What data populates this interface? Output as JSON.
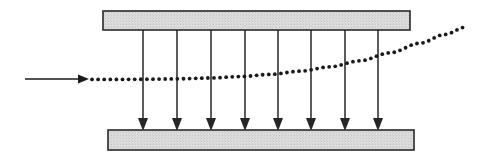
{
  "figure": {
    "canvas": {
      "width": 495,
      "height": 164,
      "background": "#ffffff"
    },
    "colors": {
      "plate_fill": "#d9d9d9",
      "plate_stroke": "#2a2a2a",
      "field_arrow": "#262626",
      "beam_arrow": "#1a1a1a",
      "trajectory_dot": "#1a1a1a"
    }
  },
  "plates": {
    "top": {
      "label": "top-plate",
      "x": 103,
      "y": 11,
      "width": 307,
      "height": 19,
      "fill": "#d9d9d9",
      "stroke": "#2a2a2a",
      "stroke_width": 1.6
    },
    "bottom": {
      "label": "bottom-plate",
      "x": 108,
      "y": 130,
      "width": 306,
      "height": 20,
      "fill": "#d9d9d9",
      "stroke": "#2a2a2a",
      "stroke_width": 1.6
    }
  },
  "field_arrows": {
    "label": "uniform-field-arrows",
    "count": 8,
    "direction": "downward",
    "y_start": 30,
    "y_end": 131,
    "stroke": "#262626",
    "stroke_width": 1.5,
    "head_width": 10,
    "head_length": 13,
    "x_positions": [
      143,
      177,
      211,
      245,
      278,
      311,
      345,
      378
    ]
  },
  "beam_arrow": {
    "label": "incoming-beam-arrow",
    "x_start": 25,
    "x_end": 89,
    "y": 79,
    "stroke": "#1a1a1a",
    "stroke_width": 1.6,
    "head_width": 9,
    "head_length": 11
  },
  "trajectory": {
    "label": "deflected-beam-path",
    "style": "dotted",
    "dot_radius": 1.9,
    "dot_spacing": 6.1,
    "color": "#1a1a1a",
    "x_start": 92,
    "x_end": 466,
    "y_start": 79,
    "y_end": 27,
    "curve_points": [
      [
        92,
        79.4
      ],
      [
        120,
        79.4
      ],
      [
        150,
        79.2
      ],
      [
        180,
        78.8
      ],
      [
        210,
        78.0
      ],
      [
        240,
        76.6
      ],
      [
        270,
        74.4
      ],
      [
        300,
        71.2
      ],
      [
        330,
        66.8
      ],
      [
        360,
        60.8
      ],
      [
        390,
        52.8
      ],
      [
        420,
        43.2
      ],
      [
        445,
        34.4
      ],
      [
        466,
        27.0
      ]
    ]
  }
}
